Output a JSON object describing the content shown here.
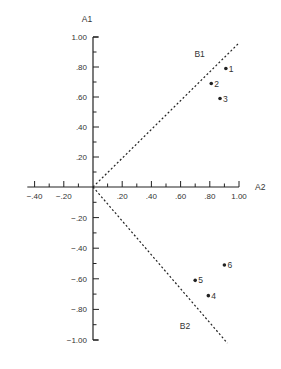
{
  "chart_data": {
    "type": "scatter",
    "title": "",
    "xlabel": "A2",
    "ylabel": "A1",
    "xlim": [
      -0.45,
      1.05
    ],
    "ylim": [
      -1.0,
      1.0
    ],
    "x_ticks": [
      -0.4,
      -0.3,
      -0.2,
      -0.1,
      0.1,
      0.2,
      0.3,
      0.4,
      0.5,
      0.6,
      0.7,
      0.8,
      0.9,
      1.0
    ],
    "x_tick_labels": [
      {
        "value": -0.4,
        "label": "−.40"
      },
      {
        "value": -0.2,
        "label": "−.20"
      },
      {
        "value": 0.2,
        "label": ".20"
      },
      {
        "value": 0.4,
        "label": ".40"
      },
      {
        "value": 0.6,
        "label": ".60"
      },
      {
        "value": 0.8,
        "label": ".80"
      },
      {
        "value": 1.0,
        "label": "1.00"
      }
    ],
    "y_ticks": [
      1.0,
      0.9,
      0.8,
      0.7,
      0.6,
      0.5,
      0.4,
      0.3,
      0.2,
      0.1,
      -0.1,
      -0.2,
      -0.3,
      -0.4,
      -0.5,
      -0.6,
      -0.7,
      -0.8,
      -0.9,
      -1.0
    ],
    "y_tick_labels": [
      {
        "value": 1.0,
        "label": "1.00"
      },
      {
        "value": 0.8,
        "label": ".80"
      },
      {
        "value": 0.6,
        "label": ".60"
      },
      {
        "value": 0.4,
        "label": ".40"
      },
      {
        "value": 0.2,
        "label": ".20"
      },
      {
        "value": -0.2,
        "label": "−.20"
      },
      {
        "value": -0.4,
        "label": "−.40"
      },
      {
        "value": -0.6,
        "label": "−.60"
      },
      {
        "value": -0.8,
        "label": "−.80"
      },
      {
        "value": -1.0,
        "label": "−1.00"
      }
    ],
    "points": [
      {
        "label": "1",
        "x": 0.91,
        "y": 0.79
      },
      {
        "label": "2",
        "x": 0.81,
        "y": 0.69
      },
      {
        "label": "3",
        "x": 0.87,
        "y": 0.59
      },
      {
        "label": "4",
        "x": 0.79,
        "y": -0.71
      },
      {
        "label": "5",
        "x": 0.7,
        "y": -0.61
      },
      {
        "label": "6",
        "x": 0.9,
        "y": -0.51
      }
    ],
    "rotated_axes": [
      {
        "name": "B1",
        "style": "dotted",
        "from": [
          0,
          0
        ],
        "to": [
          1.0,
          0.96
        ],
        "label_pos": [
          0.73,
          0.87
        ]
      },
      {
        "name": "B2",
        "style": "dotted",
        "from": [
          0,
          0
        ],
        "to": [
          0.92,
          -1.02
        ],
        "label_pos": [
          0.63,
          -0.93
        ]
      }
    ],
    "grid": false,
    "legend": null
  },
  "colors": {
    "ink": "#222222",
    "text": "#333333",
    "background": "#ffffff"
  }
}
